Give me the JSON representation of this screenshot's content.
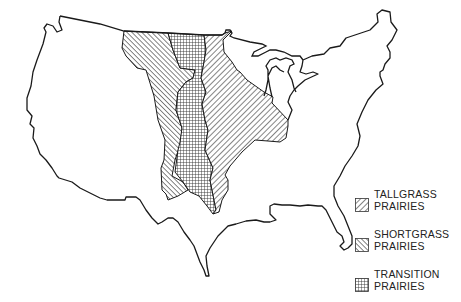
{
  "map": {
    "subject": "Prairie regions of the United States",
    "outline_color": "#1a1a1a",
    "background_color": "#ffffff",
    "regions": [
      {
        "id": "shortgrass",
        "pattern": "diagonal-down-hatch"
      },
      {
        "id": "transition",
        "pattern": "crosshatch-grid"
      },
      {
        "id": "tallgrass",
        "pattern": "diagonal-up-hatch"
      }
    ]
  },
  "legend": {
    "items": [
      {
        "line1": "TALLGRASS",
        "line2": "PRAIRIES",
        "pattern": "diagonal-up-hatch"
      },
      {
        "line1": "SHORTGRASS",
        "line2": "PRAIRIES",
        "pattern": "diagonal-down-hatch"
      },
      {
        "line1": "TRANSITION",
        "line2": "PRAIRIES",
        "pattern": "crosshatch-grid"
      }
    ]
  }
}
